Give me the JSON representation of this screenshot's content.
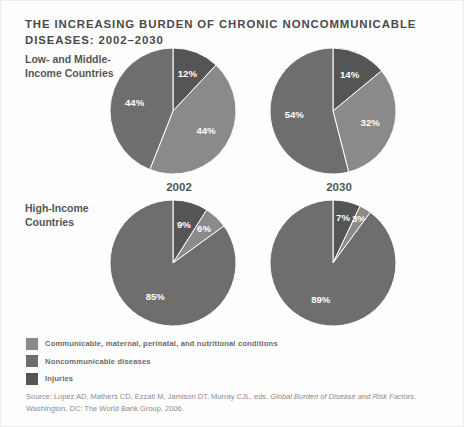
{
  "figure": {
    "title": "THE INCREASING BURDEN OF CHRONIC NONCOMMUNICABLE DISEASES: 2002–2030",
    "background": "#fefefe"
  },
  "row_labels": {
    "low_middle": "Low- and Middle-Income Countries",
    "high": "High-Income Countries"
  },
  "year_labels": {
    "left": "2002",
    "right": "2030"
  },
  "legend": {
    "items": [
      {
        "label": "Communicable, maternal, perinatal, and nutritional conditions",
        "color": "#8a8a8a"
      },
      {
        "label": "Noncommunicable diseases",
        "color": "#6e6e6e"
      },
      {
        "label": "Injuries",
        "color": "#555555"
      }
    ]
  },
  "source": {
    "line1_pre": "Source: Lopez AD, Mathers CD, Ezzati M, Jamison DT, Murray CJL, eds. ",
    "line1_italic": "Global Burden of Disease and",
    "line2_italic": "Risk Factors",
    "line2_post": ". Washington, DC: The World Bank Group, 2006."
  },
  "chart_data": {
    "type": "pie",
    "title": "THE INCREASING BURDEN OF CHRONIC NONCOMMUNICABLE DISEASES: 2002–2030",
    "legend_position": "bottom-left",
    "categories": [
      "Injuries",
      "Communicable, maternal, perinatal, and nutritional conditions",
      "Noncommunicable diseases"
    ],
    "colors": [
      "#555555",
      "#8a8a8a",
      "#6e6e6e"
    ],
    "units": "percent",
    "slice_order": "clockwise from 12 o'clock: Injuries, Communicable, Noncommunicable",
    "panels": [
      {
        "id": "low-middle-2002",
        "row": "Low- and Middle-Income Countries",
        "year": "2002",
        "values": [
          12,
          44,
          44
        ],
        "labels": [
          "12%",
          "44%",
          "44%"
        ]
      },
      {
        "id": "low-middle-2030",
        "row": "Low- and Middle-Income Countries",
        "year": "2030",
        "values": [
          14,
          32,
          54
        ],
        "labels": [
          "14%",
          "32%",
          "54%"
        ]
      },
      {
        "id": "high-2002",
        "row": "High-Income Countries",
        "year": "2002",
        "values": [
          9,
          6,
          85
        ],
        "labels": [
          "9%",
          "6%",
          "85%"
        ]
      },
      {
        "id": "high-2030",
        "row": "High-Income Countries",
        "year": "2030",
        "values": [
          7,
          3,
          89
        ],
        "labels": [
          "7%",
          "3%",
          "89%"
        ]
      }
    ]
  }
}
